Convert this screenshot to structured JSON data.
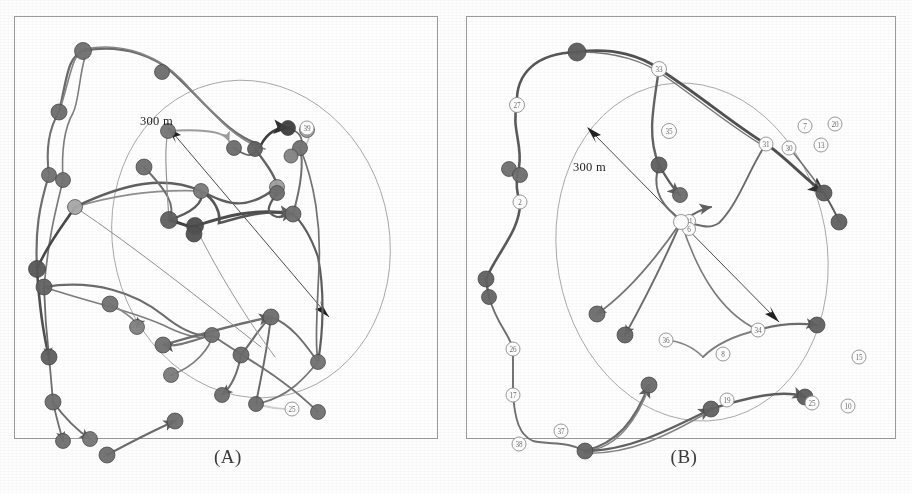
{
  "figure": {
    "type": "two-panel-trajectory-map",
    "scale_label": "300 m",
    "panels": [
      {
        "id": "A",
        "caption": "(A)",
        "scale_label": "300 m",
        "ellipse": {
          "cx": 236,
          "cy": 222,
          "rx": 138,
          "ry": 160,
          "rotation": -14
        },
        "scale_arrow": {
          "x1": 314,
          "y1": 300,
          "x2": 152,
          "y2": 110
        },
        "filled_nodes": [
          {
            "id": "a1",
            "x": 68,
            "y": 34,
            "r": 8.5,
            "shade": "#6e6e6e"
          },
          {
            "id": "a2",
            "x": 147,
            "y": 55,
            "r": 7.5,
            "shade": "#6b6b6b"
          },
          {
            "id": "a3",
            "x": 44,
            "y": 95,
            "r": 8.0,
            "shade": "#6a6a6a"
          },
          {
            "id": "a4",
            "x": 34,
            "y": 158,
            "r": 7.5,
            "shade": "#707070"
          },
          {
            "id": "a5",
            "x": 48,
            "y": 163,
            "r": 7.5,
            "shade": "#6f6f6f"
          },
          {
            "id": "a6",
            "x": 60,
            "y": 190,
            "r": 7.5,
            "shade": "#a8a8a8"
          },
          {
            "id": "a7",
            "x": 153,
            "y": 114,
            "r": 7.5,
            "shade": "#747474"
          },
          {
            "id": "a8",
            "x": 219,
            "y": 131,
            "r": 7.5,
            "shade": "#6a6a6a"
          },
          {
            "id": "a9",
            "x": 129,
            "y": 150,
            "r": 8.0,
            "shade": "#6d6d6d"
          },
          {
            "id": "a10",
            "x": 240,
            "y": 132,
            "r": 7.5,
            "shade": "#5f5f5f"
          },
          {
            "id": "a11",
            "x": 273,
            "y": 111,
            "r": 7.5,
            "shade": "#3a3a3a"
          },
          {
            "id": "a12",
            "x": 292,
            "y": 113,
            "r": 7.5,
            "shade": "#9d9d9d"
          },
          {
            "id": "a13",
            "x": 285,
            "y": 131,
            "r": 7.5,
            "shade": "#717171"
          },
          {
            "id": "a14",
            "x": 186,
            "y": 174,
            "r": 7.5,
            "shade": "#7a7a7a"
          },
          {
            "id": "a15",
            "x": 262,
            "y": 170,
            "r": 7.5,
            "shade": "#9e9e9e"
          },
          {
            "id": "a16",
            "x": 262,
            "y": 176,
            "r": 7.5,
            "shade": "#6a6a6a"
          },
          {
            "id": "a17",
            "x": 154,
            "y": 203,
            "r": 8.5,
            "shade": "#5d5d5d"
          },
          {
            "id": "a18",
            "x": 180,
            "y": 209,
            "r": 8.5,
            "shade": "#4a4a4a"
          },
          {
            "id": "a19",
            "x": 179,
            "y": 217,
            "r": 8.0,
            "shade": "#4f4f4f"
          },
          {
            "id": "a20",
            "x": 278,
            "y": 197,
            "r": 8.0,
            "shade": "#6b6b6b"
          },
          {
            "id": "a21",
            "x": 22,
            "y": 252,
            "r": 8.5,
            "shade": "#555555"
          },
          {
            "id": "a22",
            "x": 29,
            "y": 270,
            "r": 8.0,
            "shade": "#606060"
          },
          {
            "id": "a23",
            "x": 95,
            "y": 287,
            "r": 8.0,
            "shade": "#707070"
          },
          {
            "id": "a24",
            "x": 122,
            "y": 310,
            "r": 7.5,
            "shade": "#808080"
          },
          {
            "id": "a25",
            "x": 148,
            "y": 328,
            "r": 8.0,
            "shade": "#6f6f6f"
          },
          {
            "id": "a26",
            "x": 197,
            "y": 318,
            "r": 7.5,
            "shade": "#707070"
          },
          {
            "id": "a27",
            "x": 256,
            "y": 300,
            "r": 8.0,
            "shade": "#6c6c6c"
          },
          {
            "id": "a28",
            "x": 226,
            "y": 338,
            "r": 8.0,
            "shade": "#686868"
          },
          {
            "id": "a29",
            "x": 34,
            "y": 340,
            "r": 8.0,
            "shade": "#5d5d5d"
          },
          {
            "id": "a30",
            "x": 156,
            "y": 358,
            "r": 7.5,
            "shade": "#7a7a7a"
          },
          {
            "id": "a31",
            "x": 303,
            "y": 345,
            "r": 7.5,
            "shade": "#707070"
          },
          {
            "id": "a32",
            "x": 207,
            "y": 378,
            "r": 7.5,
            "shade": "#6b6b6b"
          },
          {
            "id": "a33",
            "x": 241,
            "y": 387,
            "r": 7.5,
            "shade": "#6a6a6a"
          },
          {
            "id": "a34",
            "x": 303,
            "y": 395,
            "r": 7.5,
            "shade": "#6f6f6f"
          },
          {
            "id": "a35",
            "x": 38,
            "y": 385,
            "r": 8.0,
            "shade": "#6b6b6b"
          },
          {
            "id": "a36",
            "x": 48,
            "y": 424,
            "r": 7.5,
            "shade": "#6d6d6d"
          },
          {
            "id": "a37",
            "x": 75,
            "y": 422,
            "r": 7.5,
            "shade": "#757575"
          },
          {
            "id": "a38",
            "x": 92,
            "y": 438,
            "r": 8.0,
            "shade": "#6b6b6b"
          },
          {
            "id": "a39",
            "x": 160,
            "y": 404,
            "r": 8.0,
            "shade": "#6a6a6a"
          },
          {
            "id": "a40",
            "x": 276,
            "y": 139,
            "r": 7.0,
            "shade": "#828282"
          }
        ],
        "open_nodes": [
          {
            "id": "a-o1",
            "x": 292,
            "y": 111,
            "r": 7.0,
            "label": "39"
          },
          {
            "id": "a-o2",
            "x": 277,
            "y": 392,
            "r": 7.0,
            "label": "25"
          }
        ]
      },
      {
        "id": "B",
        "caption": "(B)",
        "scale_label": "300 m",
        "ellipse": {
          "cx": 225,
          "cy": 235,
          "rx": 135,
          "ry": 170,
          "rotation": -10
        },
        "scale_arrow": {
          "x1": 312,
          "y1": 305,
          "x2": 120,
          "y2": 110
        },
        "filled_nodes": [
          {
            "id": "b1",
            "x": 110,
            "y": 35,
            "r": 9.0,
            "shade": "#5a5a5a"
          },
          {
            "id": "b2",
            "x": 42,
            "y": 152,
            "r": 7.5,
            "shade": "#6e6e6e"
          },
          {
            "id": "b3",
            "x": 53,
            "y": 158,
            "r": 7.5,
            "shade": "#6d6d6d"
          },
          {
            "id": "b4",
            "x": 19,
            "y": 262,
            "r": 8.0,
            "shade": "#5f5f5f"
          },
          {
            "id": "b5",
            "x": 22,
            "y": 280,
            "r": 7.5,
            "shade": "#646464"
          },
          {
            "id": "b6",
            "x": 192,
            "y": 148,
            "r": 8.0,
            "shade": "#5d5d5d"
          },
          {
            "id": "b7",
            "x": 213,
            "y": 178,
            "r": 7.5,
            "shade": "#6a6a6a"
          },
          {
            "id": "b8",
            "x": 357,
            "y": 176,
            "r": 8.0,
            "shade": "#5a5a5a"
          },
          {
            "id": "b9",
            "x": 372,
            "y": 205,
            "r": 8.0,
            "shade": "#5e5e5e"
          },
          {
            "id": "b10",
            "x": 130,
            "y": 297,
            "r": 8.0,
            "shade": "#6a6a6a"
          },
          {
            "id": "b11",
            "x": 158,
            "y": 318,
            "r": 8.0,
            "shade": "#636363"
          },
          {
            "id": "b12",
            "x": 350,
            "y": 308,
            "r": 8.0,
            "shade": "#5e5e5e"
          },
          {
            "id": "b13",
            "x": 182,
            "y": 368,
            "r": 8.0,
            "shade": "#686868"
          },
          {
            "id": "b14",
            "x": 244,
            "y": 392,
            "r": 8.0,
            "shade": "#5f5f5f"
          },
          {
            "id": "b15",
            "x": 338,
            "y": 380,
            "r": 8.0,
            "shade": "#5b5b5b"
          },
          {
            "id": "b16",
            "x": 118,
            "y": 434,
            "r": 8.0,
            "shade": "#636363"
          }
        ],
        "open_nodes": [
          {
            "id": "b-o1",
            "x": 192,
            "y": 52,
            "r": 7.5,
            "label": "33"
          },
          {
            "id": "b-o2",
            "x": 50,
            "y": 88,
            "r": 7.5,
            "label": "27"
          },
          {
            "id": "b-o3",
            "x": 53,
            "y": 185,
            "r": 7.0,
            "label": "2"
          },
          {
            "id": "b-o4",
            "x": 202,
            "y": 114,
            "r": 7.5,
            "label": "35"
          },
          {
            "id": "b-o5",
            "x": 299,
            "y": 127,
            "r": 7.0,
            "label": "31"
          },
          {
            "id": "b-o6",
            "x": 322,
            "y": 131,
            "r": 7.0,
            "label": "30"
          },
          {
            "id": "b-o7",
            "x": 338,
            "y": 109,
            "r": 7.0,
            "label": "7"
          },
          {
            "id": "b-o8",
            "x": 368,
            "y": 107,
            "r": 7.0,
            "label": "20"
          },
          {
            "id": "b-o9",
            "x": 354,
            "y": 128,
            "r": 7.0,
            "label": "13"
          },
          {
            "id": "b-o10",
            "x": 222,
            "y": 204,
            "r": 6.5,
            "label": "21"
          },
          {
            "id": "b-o11",
            "x": 222,
            "y": 212,
            "r": 6.5,
            "label": "6"
          },
          {
            "id": "b-o12",
            "x": 214,
            "y": 205,
            "r": 7.5,
            "label": ""
          },
          {
            "id": "b-o13",
            "x": 199,
            "y": 323,
            "r": 7.0,
            "label": "36"
          },
          {
            "id": "b-o14",
            "x": 291,
            "y": 313,
            "r": 7.0,
            "label": "34"
          },
          {
            "id": "b-o15",
            "x": 256,
            "y": 337,
            "r": 7.0,
            "label": "8"
          },
          {
            "id": "b-o16",
            "x": 392,
            "y": 340,
            "r": 7.0,
            "label": "15"
          },
          {
            "id": "b-o17",
            "x": 260,
            "y": 383,
            "r": 7.0,
            "label": "19"
          },
          {
            "id": "b-o18",
            "x": 345,
            "y": 386,
            "r": 7.0,
            "label": "25"
          },
          {
            "id": "b-o19",
            "x": 381,
            "y": 389,
            "r": 7.0,
            "label": "10"
          },
          {
            "id": "b-o20",
            "x": 46,
            "y": 332,
            "r": 7.0,
            "label": "26"
          },
          {
            "id": "b-o21",
            "x": 46,
            "y": 378,
            "r": 7.0,
            "label": "17"
          },
          {
            "id": "b-o22",
            "x": 52,
            "y": 427,
            "r": 7.0,
            "label": "38"
          },
          {
            "id": "b-o23",
            "x": 94,
            "y": 414,
            "r": 7.0,
            "label": "37"
          }
        ]
      }
    ]
  }
}
